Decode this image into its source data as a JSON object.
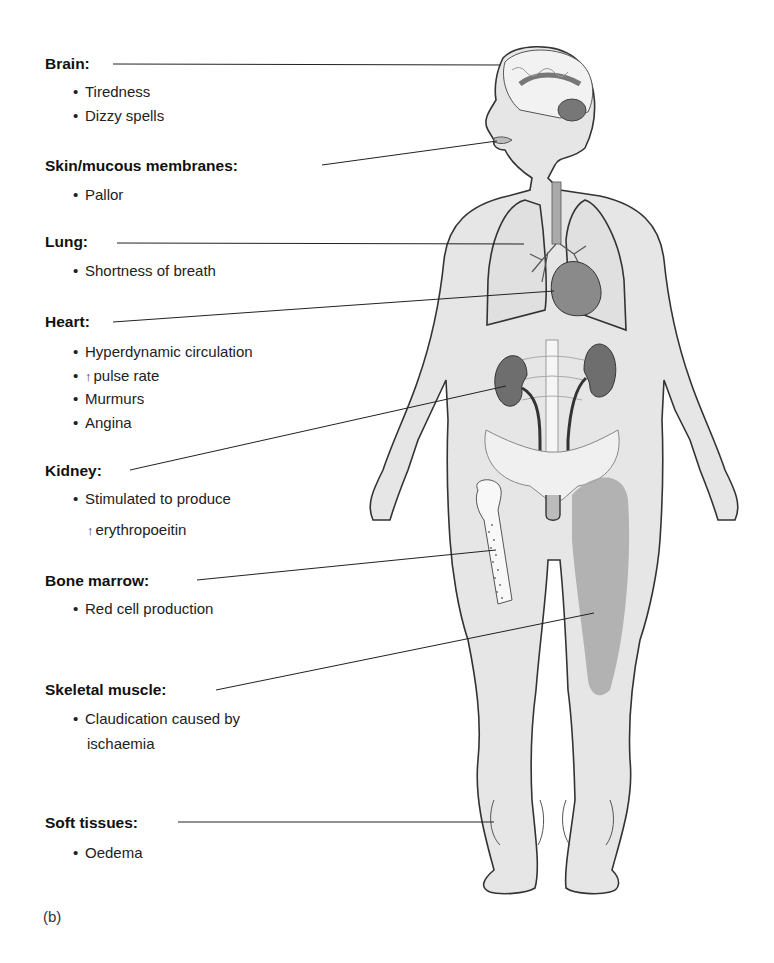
{
  "figure": {
    "caption": "(b)",
    "labels": [
      {
        "id": "brain",
        "heading": "Brain:",
        "items": [
          "Tiredness",
          "Dizzy spells"
        ]
      },
      {
        "id": "skin",
        "heading": "Skin/mucous membranes:",
        "items": [
          "Pallor"
        ]
      },
      {
        "id": "lung",
        "heading": "Lung:",
        "items": [
          "Shortness of breath"
        ]
      },
      {
        "id": "heart",
        "heading": "Heart:",
        "items": [
          "Hyperdynamic circulation",
          "pulse rate",
          "Murmurs",
          "Angina"
        ],
        "arrow_item_index": 1
      },
      {
        "id": "kidney",
        "heading": "Kidney:",
        "items": [
          "Stimulated to produce"
        ],
        "continuation": "erythropoeitin",
        "continuation_arrow": true
      },
      {
        "id": "bone_marrow",
        "heading": "Bone marrow:",
        "items": [
          "Red cell production"
        ]
      },
      {
        "id": "skeletal_muscle",
        "heading": "Skeletal muscle:",
        "items": [
          "Claudication caused by"
        ],
        "continuation": "ischaemia"
      },
      {
        "id": "soft_tissues",
        "heading": "Soft tissues:",
        "items": [
          "Oedema"
        ]
      }
    ],
    "bullet_glyph": "•",
    "up_arrow_glyph": "↑",
    "colors": {
      "skin_fill": "#e6e6e6",
      "outline": "#333333",
      "organ_dark": "#6e6e6e",
      "muscle": "#a8a8a8",
      "leader_line": "#222222"
    }
  }
}
